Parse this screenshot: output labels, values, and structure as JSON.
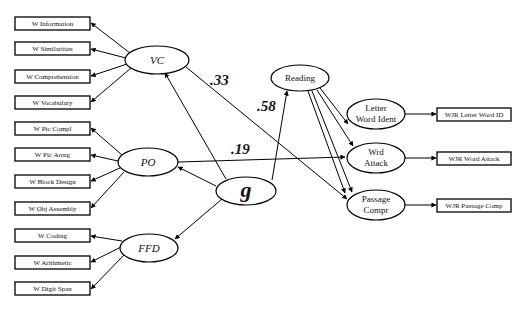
{
  "diagram": {
    "type": "structural-equation-model",
    "indicators_left": {
      "VC": [
        "W Information",
        "W Similarities",
        "W Comprehension",
        "W Vocabulary"
      ],
      "PO": [
        "W Pic Compl",
        "W Pic Arrng",
        "W Block Design",
        "W Obj Assembly"
      ],
      "FFD": [
        "W Coding",
        "W Arithmetic",
        "W Digit Span"
      ]
    },
    "latents": {
      "VC": "VC",
      "PO": "PO",
      "FFD": "FFD",
      "g": "g",
      "reading": "Reading",
      "lwi_line1": "Letter",
      "lwi_line2": "Word Ident",
      "wa_line1": "Wrd",
      "wa_line2": "Attack",
      "pc_line1": "Passage",
      "pc_line2": "Compr"
    },
    "indicators_right": [
      "WJR Letter Word ID",
      "WJR Word Attack",
      "WJR Passage Comp"
    ],
    "coefficients": {
      "vc_to_passage": ".33",
      "g_to_reading": ".58",
      "po_to_wordattack": ".19"
    }
  }
}
